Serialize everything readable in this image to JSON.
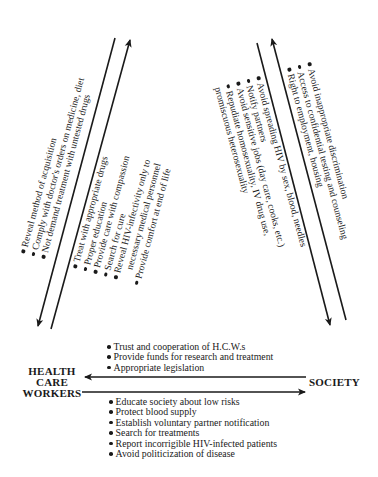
{
  "diagram": {
    "nodes": {
      "health_care_workers": [
        "HEALTH",
        "CARE",
        "WORKERS"
      ],
      "society": "SOCIETY"
    },
    "left_diagonal": {
      "patient_obligations_to_hcw": [
        {
          "text": "Reveal method of acquisition"
        },
        {
          "text": "Comply with doctor's orders on medicine, diet"
        },
        {
          "text": "Not demand treatment with untested drugs"
        }
      ],
      "hcw_obligations_to_patient": [
        {
          "text": "Treat with appropriate drugs"
        },
        {
          "text": "Proper education"
        },
        {
          "text": "Provide care with compassion"
        },
        {
          "text": "Search for cure"
        },
        {
          "text": "Reveal HIV-infectivity only to",
          "continuation": "necessary medical personnel"
        },
        {
          "text": "Provide comfort at end of life"
        }
      ]
    },
    "right_diagonal": {
      "patient_obligations_to_society": [
        {
          "text": "Avoid spreading HIV by sex, blood, needles"
        },
        {
          "text": "Notify partners"
        },
        {
          "text": "Avoid sensitive jobs (day care, cooks, etc.)"
        },
        {
          "text": "Repudiate homosexuality, IV drug use,",
          "continuation": "promiscuous heterosexuality"
        }
      ],
      "society_obligations_to_patient": [
        {
          "text": "Avoid inappropriate discrimination"
        },
        {
          "text": "Access to confidential testing and counseling"
        },
        {
          "text": "Right to employment, housing"
        }
      ]
    },
    "horizontal": {
      "society_to_hcw": [
        {
          "text": "Trust and cooperation of H.C.W.s"
        },
        {
          "text": "Provide funds for research and treatment"
        },
        {
          "text": "Appropriate legislation"
        }
      ],
      "hcw_to_society": [
        {
          "text": "Educate society about low risks"
        },
        {
          "text": "Protect blood supply"
        },
        {
          "text": "Establish voluntary partner notification"
        },
        {
          "text": "Search for treatments"
        },
        {
          "text": "Report incorrigible HIV-infected patients"
        },
        {
          "text": "Avoid politicization of disease"
        }
      ]
    },
    "colors": {
      "ink": "#1a1a1a",
      "background": "#ffffff"
    }
  }
}
